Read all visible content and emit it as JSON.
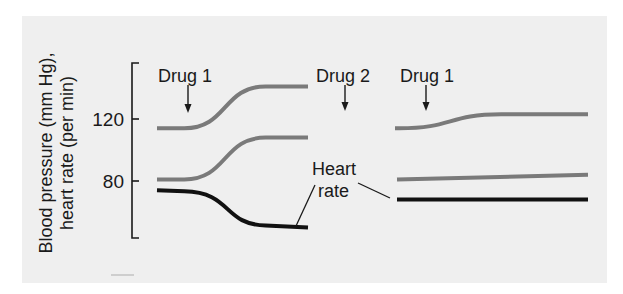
{
  "chart_data": {
    "type": "line",
    "title": "",
    "ylabel": "Blood pressure (mm Hg), heart rate (per min)",
    "ylabel_lines": [
      "Blood pressure (mm Hg),",
      "heart rate (per min)"
    ],
    "xlabel": "",
    "yticks": [
      80,
      120
    ],
    "ylim": [
      43,
      156
    ],
    "grid": false,
    "legend": "none",
    "panels": [
      {
        "name": "left",
        "annotations": [
          {
            "label": "Drug 1",
            "type": "arrow"
          }
        ],
        "series": [
          {
            "name": "Systolic blood pressure",
            "color": "#7a7a7a",
            "shape": "sigmoid",
            "start": 114,
            "end": 141
          },
          {
            "name": "Diastolic blood pressure",
            "color": "#7a7a7a",
            "shape": "sigmoid",
            "start": 81,
            "end": 108
          },
          {
            "name": "Heart rate",
            "color": "#111111",
            "shape": "sigmoid",
            "start": 74,
            "end": 50
          }
        ]
      },
      {
        "name": "right",
        "annotations": [
          {
            "label": "Drug 2",
            "type": "arrow"
          },
          {
            "label": "Drug 1",
            "type": "arrow"
          }
        ],
        "series": [
          {
            "name": "Systolic blood pressure",
            "color": "#7a7a7a",
            "shape": "sigmoid",
            "start": 114,
            "end": 123
          },
          {
            "name": "Diastolic blood pressure",
            "color": "#7a7a7a",
            "shape": "linear",
            "start": 81,
            "end": 84
          },
          {
            "name": "Heart rate",
            "color": "#111111",
            "shape": "flat",
            "start": 68,
            "end": 68
          }
        ]
      }
    ],
    "series_label": {
      "line1": "Heart",
      "line2": "rate"
    }
  },
  "colors": {
    "panel_bg": "#efefef",
    "bp_line": "#7a7a7a",
    "hr_line": "#111111"
  }
}
